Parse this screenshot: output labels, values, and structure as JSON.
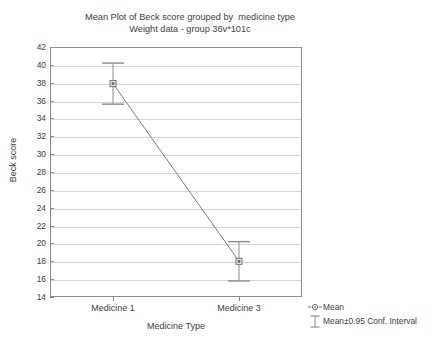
{
  "chart_data": {
    "type": "line",
    "title": "Mean Plot of Beck score grouped by  medicine type",
    "subtitle": "Weight data - group 36v*101c",
    "xlabel": "Medicine Type",
    "ylabel": "Beck score",
    "categories": [
      "Medicine 1",
      "Medicine 3"
    ],
    "values": [
      37.9,
      18.0
    ],
    "error_low": [
      35.6,
      15.8
    ],
    "error_high": [
      40.2,
      20.2
    ],
    "ylim": [
      14,
      42
    ],
    "ytick_step": 2,
    "yticks": [
      42,
      40,
      38,
      36,
      34,
      32,
      30,
      28,
      26,
      24,
      22,
      20,
      18,
      16,
      14
    ],
    "grid": true,
    "legend_position": "bottom-right",
    "legend": [
      {
        "label": "Mean",
        "marker": "circle-dot-marker"
      },
      {
        "label": "Mean±0.95 Conf. Interval",
        "marker": "error-bar-marker"
      }
    ],
    "colors": {
      "line": "#7a7a7a",
      "marker": "#6b6b6b",
      "errorbar": "#8a8a8a",
      "grid": "#d6d6d6",
      "axis": "#8a8a8a",
      "text": "#3d3d3d",
      "background": "#ffffff"
    }
  }
}
